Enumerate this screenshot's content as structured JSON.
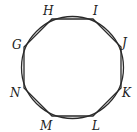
{
  "diagram": {
    "type": "regular octagon inscribed in circle",
    "circle": {
      "cx": 72.5,
      "cy": 67.5,
      "r": 51
    },
    "stroke_color": "#2a2a2a",
    "vertices": [
      {
        "label": "H",
        "x": 52,
        "y": 19,
        "lx": 43,
        "ly": 15
      },
      {
        "label": "I",
        "x": 93,
        "y": 19,
        "lx": 93,
        "ly": 15
      },
      {
        "label": "J",
        "x": 121,
        "y": 47,
        "lx": 122,
        "ly": 47
      },
      {
        "label": "K",
        "x": 121,
        "y": 88,
        "lx": 122,
        "ly": 97
      },
      {
        "label": "L",
        "x": 93,
        "y": 116,
        "lx": 92,
        "ly": 130
      },
      {
        "label": "M",
        "x": 52,
        "y": 116,
        "lx": 40,
        "ly": 130
      },
      {
        "label": "N",
        "x": 24,
        "y": 88,
        "lx": 10,
        "ly": 97
      },
      {
        "label": "G",
        "x": 24,
        "y": 47,
        "lx": 12,
        "ly": 49
      }
    ]
  }
}
